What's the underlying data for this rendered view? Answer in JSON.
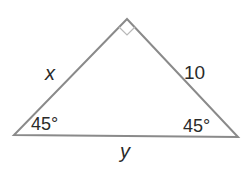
{
  "figure": {
    "type": "right-triangle",
    "vertices": {
      "apex": {
        "x": 127,
        "y": 19
      },
      "left": {
        "x": 14,
        "y": 135
      },
      "right": {
        "x": 238,
        "y": 137
      }
    },
    "right_angle_at": "apex",
    "stroke_color": "#8a8a8a",
    "marker_color": "#b8b8b8",
    "labels": {
      "left_leg": "x",
      "right_leg": "10",
      "hypotenuse": "y",
      "left_angle": "45°",
      "right_angle": "45°"
    }
  }
}
